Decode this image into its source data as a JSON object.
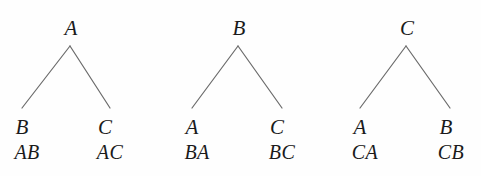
{
  "figure": {
    "background_color": "#fefefe",
    "edge_color": "#6b6b6b",
    "text_color": "#1a1a1a",
    "trees": [
      {
        "name": "tree-a",
        "root": {
          "label": "A",
          "x": 70,
          "y": 30
        },
        "apex": {
          "x": 70,
          "y": 46
        },
        "children": [
          {
            "label": "B",
            "path": "AB",
            "x": 22,
            "y": 108
          },
          {
            "label": "C",
            "path": "AC",
            "x": 105,
            "y": 108
          }
        ]
      },
      {
        "name": "tree-b",
        "root": {
          "label": "B",
          "x": 238,
          "y": 30
        },
        "apex": {
          "x": 238,
          "y": 46
        },
        "children": [
          {
            "label": "A",
            "path": "BA",
            "x": 192,
            "y": 108
          },
          {
            "label": "C",
            "path": "BC",
            "x": 277,
            "y": 108
          }
        ]
      },
      {
        "name": "tree-c",
        "root": {
          "label": "C",
          "x": 406,
          "y": 30
        },
        "apex": {
          "x": 406,
          "y": 46
        },
        "children": [
          {
            "label": "A",
            "path": "CA",
            "x": 360,
            "y": 108
          },
          {
            "label": "B",
            "path": "CB",
            "x": 446,
            "y": 108
          }
        ]
      }
    ]
  },
  "labels": {
    "tree1": {
      "root": "A",
      "left_leaf": "B",
      "right_leaf": "C",
      "left_path": "AB",
      "right_path": "AC"
    },
    "tree2": {
      "root": "B",
      "left_leaf": "A",
      "right_leaf": "C",
      "left_path": "BA",
      "right_path": "BC"
    },
    "tree3": {
      "root": "C",
      "left_leaf": "A",
      "right_leaf": "B",
      "left_path": "CA",
      "right_path": "CB"
    }
  }
}
